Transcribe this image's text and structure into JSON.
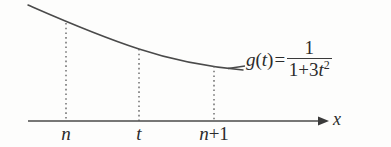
{
  "figure": {
    "background_color": "#fdfdfc",
    "ink_color": "#3a3a3a",
    "text_color": "#2b2b2b",
    "axis": {
      "label": "x",
      "arrow": "right-arrow",
      "y": 121,
      "x_start": 28,
      "x_end": 325
    },
    "curve": {
      "label_fn": "g",
      "label_var": "t",
      "description": "decreasing convex curve",
      "points": [
        [
          28,
          5
        ],
        [
          66,
          23
        ],
        [
          139,
          49
        ],
        [
          214,
          66
        ],
        [
          243,
          70
        ]
      ]
    },
    "formula": {
      "function_name": "g",
      "open_paren": "(",
      "argument": "t",
      "close_paren": ")",
      "equals": "=",
      "numerator": "1",
      "denominator_one": "1",
      "denominator_plus": "+",
      "denominator_coefficient": "3",
      "denominator_variable": "t",
      "denominator_exponent": "2"
    },
    "ticks": [
      {
        "name": "n",
        "label": "n",
        "x": 66,
        "curve_y": 23
      },
      {
        "name": "t",
        "label": "t",
        "x": 139,
        "curve_y": 49
      },
      {
        "name": "n-plus-1",
        "label_var": "n",
        "label_op": "+",
        "label_num": "1",
        "x": 214,
        "curve_y": 66
      }
    ]
  }
}
